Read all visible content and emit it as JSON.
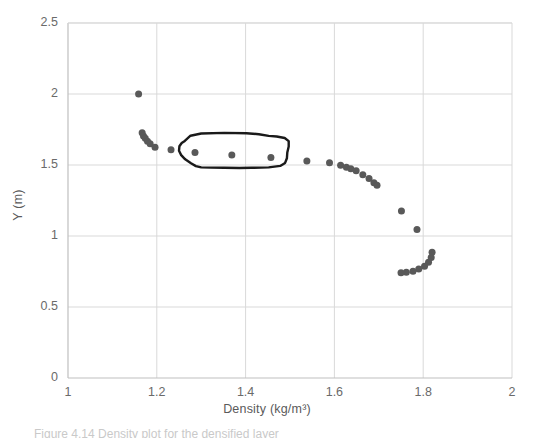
{
  "chart_data": {
    "type": "scatter",
    "title": "",
    "xlabel": "Density (kg/m³)",
    "ylabel": "Y (m)",
    "xlim": [
      1,
      2
    ],
    "ylim": [
      0,
      2.5
    ],
    "xticks": [
      "1",
      "1.2",
      "1.4",
      "1.6",
      "1.8",
      "2"
    ],
    "xtick_values": [
      1,
      1.2,
      1.4,
      1.6,
      1.8,
      2
    ],
    "yticks": [
      "0",
      "0.5",
      "1",
      "1.5",
      "2",
      "2.5"
    ],
    "ytick_values": [
      0,
      0.5,
      1,
      1.5,
      2,
      2.5
    ],
    "grid": true,
    "legend": "none",
    "marker_color": "#595959",
    "marker_size": 7,
    "gridline_color": "#d9d9d9",
    "series": [
      {
        "name": "Density profile",
        "points": [
          [
            1.159,
            2.0
          ],
          [
            1.167,
            1.727
          ],
          [
            1.17,
            1.705
          ],
          [
            1.174,
            1.688
          ],
          [
            1.179,
            1.668
          ],
          [
            1.185,
            1.65
          ],
          [
            1.196,
            1.625
          ],
          [
            1.232,
            1.608
          ],
          [
            1.286,
            1.588
          ],
          [
            1.369,
            1.571
          ],
          [
            1.457,
            1.553
          ],
          [
            1.538,
            1.528
          ],
          [
            1.589,
            1.516
          ],
          [
            1.614,
            1.498
          ],
          [
            1.627,
            1.485
          ],
          [
            1.637,
            1.473
          ],
          [
            1.649,
            1.46
          ],
          [
            1.664,
            1.432
          ],
          [
            1.678,
            1.405
          ],
          [
            1.689,
            1.375
          ],
          [
            1.696,
            1.357
          ],
          [
            1.751,
            1.176
          ],
          [
            1.786,
            1.046
          ],
          [
            1.82,
            0.885
          ],
          [
            1.818,
            0.848
          ],
          [
            1.812,
            0.815
          ],
          [
            1.803,
            0.787
          ],
          [
            1.79,
            0.768
          ],
          [
            1.777,
            0.752
          ],
          [
            1.762,
            0.745
          ],
          [
            1.75,
            0.742
          ]
        ]
      }
    ],
    "annotations": [
      {
        "type": "hand-drawn-closed-loop",
        "label": "circled-region",
        "encloses_points": [
          [
            1.286,
            1.588
          ],
          [
            1.369,
            1.571
          ],
          [
            1.457,
            1.553
          ]
        ],
        "stroke_color": "#1a1a1a",
        "stroke_width": 2.4,
        "vertices": [
          [
            1.263,
            1.67
          ],
          [
            1.276,
            1.706
          ],
          [
            1.3,
            1.722
          ],
          [
            1.352,
            1.726
          ],
          [
            1.402,
            1.724
          ],
          [
            1.43,
            1.717
          ],
          [
            1.452,
            1.705
          ],
          [
            1.47,
            1.701
          ],
          [
            1.488,
            1.69
          ],
          [
            1.497,
            1.668
          ],
          [
            1.497,
            1.63
          ],
          [
            1.494,
            1.588
          ],
          [
            1.493,
            1.547
          ],
          [
            1.489,
            1.515
          ],
          [
            1.478,
            1.494
          ],
          [
            1.452,
            1.483
          ],
          [
            1.414,
            1.48
          ],
          [
            1.386,
            1.479
          ],
          [
            1.352,
            1.48
          ],
          [
            1.322,
            1.482
          ],
          [
            1.3,
            1.483
          ],
          [
            1.288,
            1.492
          ],
          [
            1.277,
            1.512
          ],
          [
            1.264,
            1.54
          ],
          [
            1.255,
            1.57
          ],
          [
            1.25,
            1.6
          ],
          [
            1.251,
            1.632
          ],
          [
            1.256,
            1.655
          ]
        ]
      }
    ]
  },
  "caption": {
    "text": "Figure 4.14 Density plot for the densified layer"
  }
}
